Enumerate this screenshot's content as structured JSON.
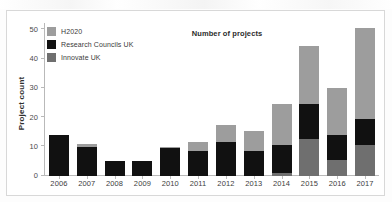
{
  "figure": {
    "title": "Number of projects",
    "ylabel": "Project count"
  },
  "legend": {
    "items": [
      {
        "label": "H2020",
        "color": "#9d9d9d"
      },
      {
        "label": "Research Councils UK",
        "color": "#111111"
      },
      {
        "label": "Innovate UK",
        "color": "#6f6f6f"
      }
    ]
  },
  "chart_data": {
    "type": "bar",
    "title": "Number of projects",
    "xlabel": "",
    "ylabel": "Project count",
    "stacked": true,
    "grid": false,
    "legend_position": "top-left",
    "ylim": [
      0,
      52
    ],
    "yticks": [
      0,
      10,
      20,
      30,
      40,
      50
    ],
    "categories": [
      "2006",
      "2007",
      "2008",
      "2009",
      "2010",
      "2011",
      "2012",
      "2013",
      "2014",
      "2015",
      "2016",
      "2017"
    ],
    "series": [
      {
        "name": "Innovate UK",
        "color": "#6f6f6f",
        "values": [
          0,
          0,
          0,
          0,
          0,
          0,
          0,
          0,
          1,
          12.5,
          5.5,
          10.5
        ]
      },
      {
        "name": "Research Councils UK",
        "color": "#111111",
        "values": [
          14,
          10,
          5,
          5,
          9.5,
          8.5,
          11.5,
          8.5,
          9.5,
          12,
          8.5,
          9
        ]
      },
      {
        "name": "H2020",
        "color": "#9d9d9d",
        "values": [
          0,
          1,
          0,
          0,
          0.5,
          3,
          6,
          7,
          14,
          20,
          16,
          31
        ]
      }
    ],
    "totals": [
      14,
      11,
      5,
      5,
      10,
      11.5,
      17.5,
      15.5,
      24.5,
      44.5,
      30,
      50.5
    ]
  }
}
